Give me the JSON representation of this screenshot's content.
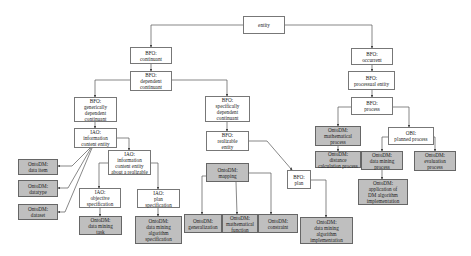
{
  "diagram": {
    "type": "ontology-hierarchy",
    "colors": {
      "upper_node_fill": "#ffffff",
      "ontodm_node_fill": "#bfbfbf",
      "edge": "#555555"
    },
    "nodes": [
      {
        "id": "entity",
        "label": "entity",
        "kind": "upper",
        "box": [
          243,
          16,
          42,
          18
        ]
      },
      {
        "id": "continuant",
        "label": "BFO:\ncontinuant",
        "kind": "upper",
        "box": [
          130,
          47,
          42,
          17
        ]
      },
      {
        "id": "dep_cont",
        "label": "BFO:\ndependent\ncontinuant",
        "kind": "upper",
        "box": [
          130,
          71,
          42,
          20
        ]
      },
      {
        "id": "gen_dep",
        "label": "BFO:\ngenerically\ndependent\ncontinuant",
        "kind": "upper",
        "box": [
          74,
          97,
          43,
          25
        ]
      },
      {
        "id": "ice",
        "label": "IAO:\ninformation\ncontent entity",
        "kind": "upper",
        "box": [
          74,
          128,
          43,
          20
        ]
      },
      {
        "id": "ice_real",
        "label": "IAO:\ninformation\ncontent entity\nabout a realizable",
        "kind": "upper",
        "box": [
          108,
          150,
          43,
          25
        ]
      },
      {
        "id": "data_item",
        "label": "OntoDM:\ndata item",
        "kind": "ontodm",
        "box": [
          18,
          159,
          40,
          16
        ]
      },
      {
        "id": "datatype",
        "label": "OntoDM:\ndatatype",
        "kind": "ontodm",
        "box": [
          18,
          180,
          40,
          17
        ]
      },
      {
        "id": "dataset",
        "label": "OntoDM:\ndataset",
        "kind": "ontodm",
        "box": [
          18,
          204,
          40,
          16
        ]
      },
      {
        "id": "obj_spec",
        "label": "IAO:\nobjective\nspecification",
        "kind": "upper",
        "box": [
          79,
          188,
          42,
          20
        ]
      },
      {
        "id": "plan_spec",
        "label": "IAO:\nplan\nspecification",
        "kind": "upper",
        "box": [
          137,
          189,
          43,
          19
        ]
      },
      {
        "id": "dm_task",
        "label": "OntoDM:\ndata mining\ntask",
        "kind": "ontodm",
        "box": [
          79,
          216,
          43,
          19
        ]
      },
      {
        "id": "dm_alg_spec",
        "label": "OntoDM:\ndata mining\nalgorithm\nspecification",
        "kind": "ontodm",
        "box": [
          135,
          216,
          47,
          28
        ]
      },
      {
        "id": "spec_dep",
        "label": "BFO:\nspecifically\ndependent\ncontinuant",
        "kind": "upper",
        "box": [
          205,
          96,
          45,
          26
        ]
      },
      {
        "id": "realizable",
        "label": "BFO:\nrealizable\nentity",
        "kind": "upper",
        "box": [
          206,
          131,
          43,
          20
        ]
      },
      {
        "id": "mapping",
        "label": "OntoDM:\nmapping",
        "kind": "ontodm",
        "box": [
          206,
          163,
          43,
          19
        ]
      },
      {
        "id": "generalization",
        "label": "OntoDM:\ngeneralization",
        "kind": "ontodm",
        "box": [
          184,
          214,
          38,
          19
        ]
      },
      {
        "id": "math_func",
        "label": "OntoDM:\nmathematical\nfunction",
        "kind": "ontodm",
        "box": [
          222,
          214,
          36,
          19
        ]
      },
      {
        "id": "constraint",
        "label": "OntoDM:\nconstraint",
        "kind": "ontodm",
        "box": [
          258,
          214,
          40,
          19
        ]
      },
      {
        "id": "plan",
        "label": "BFO:\nplan",
        "kind": "upper",
        "box": [
          287,
          170,
          24,
          19
        ]
      },
      {
        "id": "dm_alg_impl",
        "label": "OntoDM:\ndata mining\nalgorithm\nimplementation",
        "kind": "ontodm",
        "box": [
          300,
          217,
          53,
          27
        ]
      },
      {
        "id": "occurrent",
        "label": "BFO:\noccurrent",
        "kind": "upper",
        "box": [
          351,
          48,
          42,
          17
        ]
      },
      {
        "id": "processual",
        "label": "BFO:\nprocessual entity",
        "kind": "upper",
        "box": [
          348,
          71,
          47,
          19
        ]
      },
      {
        "id": "process",
        "label": "BFO:\nprocess",
        "kind": "upper",
        "box": [
          351,
          97,
          42,
          18
        ]
      },
      {
        "id": "math_process",
        "label": "OntoDM:\nmathematical\nprocess",
        "kind": "ontodm",
        "box": [
          315,
          126,
          46,
          20
        ]
      },
      {
        "id": "dist_calc",
        "label": "OntoDM:\ndistance\ncalculation process",
        "kind": "ontodm",
        "box": [
          315,
          151,
          46,
          17
        ]
      },
      {
        "id": "planned_process",
        "label": "OBI:\nplanned process",
        "kind": "upper",
        "box": [
          388,
          127,
          46,
          18
        ]
      },
      {
        "id": "dm_process",
        "label": "OntoDM:\ndata mining\nprocess",
        "kind": "ontodm",
        "box": [
          361,
          151,
          42,
          19
        ]
      },
      {
        "id": "eval_process",
        "label": "OntoDM:\nevaluation\nprocess",
        "kind": "ontodm",
        "box": [
          414,
          151,
          42,
          20
        ]
      },
      {
        "id": "app_dm_alg",
        "label": "OntoDM:\napplication of\nDM algorithm\nimplementation",
        "kind": "ontodm",
        "box": [
          358,
          179,
          50,
          26
        ]
      }
    ],
    "edges": [
      {
        "from": "entity",
        "to": "continuant",
        "path": [
          [
            243,
            25
          ],
          [
            151,
            25
          ],
          [
            151,
            47
          ]
        ]
      },
      {
        "from": "entity",
        "to": "occurrent",
        "path": [
          [
            285,
            25
          ],
          [
            372,
            25
          ],
          [
            372,
            48
          ]
        ]
      },
      {
        "from": "continuant",
        "to": "dep_cont",
        "path": [
          [
            151,
            64
          ],
          [
            151,
            71
          ]
        ]
      },
      {
        "from": "dep_cont",
        "to": "gen_dep",
        "path": [
          [
            130,
            80
          ],
          [
            95,
            80
          ],
          [
            95,
            97
          ]
        ]
      },
      {
        "from": "dep_cont",
        "to": "spec_dep",
        "path": [
          [
            172,
            80
          ],
          [
            227,
            80
          ],
          [
            227,
            96
          ]
        ]
      },
      {
        "from": "gen_dep",
        "to": "ice",
        "path": [
          [
            95,
            122
          ],
          [
            95,
            128
          ]
        ]
      },
      {
        "from": "ice",
        "to": "ice_real",
        "path": [
          [
            117,
            138
          ],
          [
            129,
            138
          ],
          [
            129,
            150
          ]
        ]
      },
      {
        "from": "ice",
        "to": "data_item",
        "path": [
          [
            90,
            148
          ],
          [
            72,
            166
          ],
          [
            58,
            166
          ]
        ]
      },
      {
        "from": "ice",
        "to": "datatype",
        "path": [
          [
            91,
            148
          ],
          [
            68,
            188
          ],
          [
            58,
            188
          ]
        ]
      },
      {
        "from": "ice",
        "to": "dataset",
        "path": [
          [
            92,
            148
          ],
          [
            65,
            212
          ],
          [
            58,
            212
          ]
        ]
      },
      {
        "from": "ice_real",
        "to": "obj_spec",
        "path": [
          [
            108,
            163
          ],
          [
            99,
            163
          ],
          [
            99,
            188
          ]
        ]
      },
      {
        "from": "ice_real",
        "to": "plan_spec",
        "path": [
          [
            151,
            163
          ],
          [
            158,
            163
          ],
          [
            158,
            189
          ]
        ]
      },
      {
        "from": "obj_spec",
        "to": "dm_task",
        "path": [
          [
            100,
            208
          ],
          [
            100,
            216
          ]
        ]
      },
      {
        "from": "plan_spec",
        "to": "dm_alg_spec",
        "path": [
          [
            158,
            208
          ],
          [
            158,
            216
          ]
        ]
      },
      {
        "from": "spec_dep",
        "to": "realizable",
        "path": [
          [
            227,
            122
          ],
          [
            227,
            131
          ]
        ]
      },
      {
        "from": "realizable",
        "to": "plan",
        "path": [
          [
            249,
            141
          ],
          [
            267,
            141
          ],
          [
            292,
            170
          ]
        ]
      },
      {
        "from": "mapping",
        "to": "generalization",
        "path": [
          [
            206,
            176
          ],
          [
            202,
            176
          ],
          [
            202,
            214
          ]
        ]
      },
      {
        "from": "mapping",
        "to": "math_func",
        "path": [
          [
            236,
            182
          ],
          [
            237,
            214
          ]
        ]
      },
      {
        "from": "mapping",
        "to": "constraint",
        "path": [
          [
            249,
            173
          ],
          [
            271,
            173
          ],
          [
            271,
            214
          ]
        ]
      },
      {
        "from": "plan",
        "to": "dm_alg_impl",
        "path": [
          [
            311,
            180
          ],
          [
            326,
            180
          ],
          [
            326,
            217
          ]
        ]
      },
      {
        "from": "occurrent",
        "to": "processual",
        "path": [
          [
            372,
            65
          ],
          [
            372,
            71
          ]
        ]
      },
      {
        "from": "processual",
        "to": "process",
        "path": [
          [
            372,
            90
          ],
          [
            372,
            97
          ]
        ]
      },
      {
        "from": "process",
        "to": "math_process",
        "path": [
          [
            351,
            107
          ],
          [
            338,
            107
          ],
          [
            338,
            126
          ]
        ]
      },
      {
        "from": "process",
        "to": "planned_process",
        "path": [
          [
            393,
            107
          ],
          [
            409,
            107
          ],
          [
            409,
            127
          ]
        ]
      },
      {
        "from": "math_process",
        "to": "dist_calc",
        "path": [
          [
            338,
            146
          ],
          [
            338,
            151
          ]
        ]
      },
      {
        "from": "planned_process",
        "to": "dm_process",
        "path": [
          [
            388,
            137
          ],
          [
            382,
            137
          ],
          [
            382,
            151
          ]
        ]
      },
      {
        "from": "planned_process",
        "to": "eval_process",
        "path": [
          [
            434,
            137
          ],
          [
            435,
            137
          ],
          [
            435,
            151
          ]
        ]
      },
      {
        "from": "dm_process",
        "to": "app_dm_alg",
        "path": [
          [
            382,
            170
          ],
          [
            382,
            179
          ]
        ]
      }
    ]
  }
}
